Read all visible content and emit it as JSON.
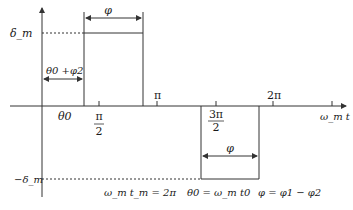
{
  "diagram": {
    "type": "waveform",
    "axis": {
      "x_label": "ω_m t",
      "y_top_label": "δ_m",
      "y_bottom_label": "−δ_m"
    },
    "ticks": {
      "theta0": "θ0",
      "pi_half_num": "π",
      "pi_half_den": "2",
      "pi": "π",
      "three_pi_half_num": "3π",
      "three_pi_half_den": "2",
      "two_pi": "2π"
    },
    "annotations": {
      "phi_top": "φ",
      "phi_bottom": "φ",
      "theta_phi2": "θ0 +φ2",
      "period": "ω_m t_m = 2π",
      "theta0_def": "θ0 = ω_m t0",
      "phi_def": "φ = φ1 − φ2"
    },
    "colors": {
      "line": "#333333",
      "text": "#1a1a1a"
    }
  }
}
